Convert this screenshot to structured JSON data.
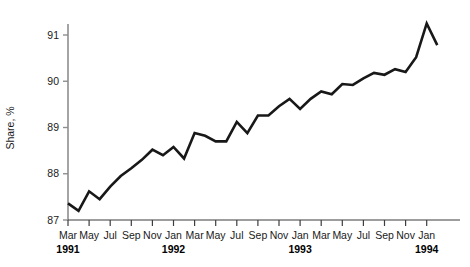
{
  "chart_data": {
    "type": "line",
    "title": "",
    "xlabel": "",
    "ylabel": "Share, %",
    "ylim": [
      87,
      91.5
    ],
    "yticks": [
      87,
      88,
      89,
      90,
      91
    ],
    "ytick_labels": [
      "87",
      "88",
      "89",
      "90",
      "91"
    ],
    "grid": false,
    "legend": null,
    "x": [
      "Mar 1991",
      "Apr 1991",
      "May 1991",
      "Jun 1991",
      "Jul 1991",
      "Aug 1991",
      "Sep 1991",
      "Oct 1991",
      "Nov 1991",
      "Dec 1991",
      "Jan 1992",
      "Feb 1992",
      "Mar 1992",
      "Apr 1992",
      "May 1992",
      "Jun 1992",
      "Jul 1992",
      "Aug 1992",
      "Sep 1992",
      "Oct 1992",
      "Nov 1992",
      "Dec 1992",
      "Jan 1993",
      "Feb 1993",
      "Mar 1993",
      "Apr 1993",
      "May 1993",
      "Jun 1993",
      "Jul 1993",
      "Aug 1993",
      "Sep 1993",
      "Oct 1993",
      "Nov 1993",
      "Dec 1993",
      "Jan 1994",
      "Feb 1994"
    ],
    "xtick_labels": [
      "Mar",
      "May",
      "Jul",
      "Sep",
      "Nov",
      "Jan",
      "Mar",
      "May",
      "Jul",
      "Sep",
      "Nov",
      "Jan",
      "Mar",
      "May",
      "Jul",
      "Sep",
      "Nov",
      "Jan"
    ],
    "xtick_indices": [
      0,
      2,
      4,
      6,
      8,
      10,
      12,
      14,
      16,
      18,
      20,
      22,
      24,
      26,
      28,
      30,
      32,
      34
    ],
    "year_markers": [
      {
        "label": "1991",
        "index": 0
      },
      {
        "label": "1992",
        "index": 10
      },
      {
        "label": "1993",
        "index": 22
      },
      {
        "label": "1994",
        "index": 34
      }
    ],
    "values": [
      87.36,
      87.2,
      87.62,
      87.45,
      87.72,
      87.95,
      88.12,
      88.3,
      88.52,
      88.4,
      88.58,
      88.33,
      88.88,
      88.82,
      88.7,
      88.7,
      89.12,
      88.88,
      89.26,
      89.26,
      89.46,
      89.62,
      89.4,
      89.62,
      89.78,
      89.72,
      89.94,
      89.92,
      90.06,
      90.18,
      90.14,
      90.26,
      90.2,
      90.52,
      91.25,
      90.78
    ],
    "series_color": "#181818",
    "axis_color": "#8e8e8e",
    "tick_color": "#3d3d3d"
  }
}
